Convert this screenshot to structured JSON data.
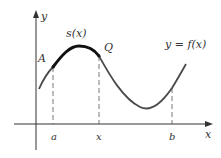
{
  "figure": {
    "axes": {
      "x_label": "x",
      "y_label": "y"
    },
    "curve_label": "y = f(x)",
    "arc_label": "s(x)",
    "points": {
      "A": "A",
      "Q": "Q"
    },
    "x_ticks": {
      "a": "a",
      "x": "x",
      "b": "b"
    },
    "colors": {
      "curve": "#4a4a4a",
      "arc": "#111111",
      "axis": "#333333",
      "guide": "#555555"
    }
  }
}
